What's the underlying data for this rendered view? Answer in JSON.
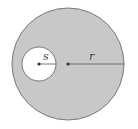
{
  "diagram": {
    "type": "geometry",
    "colors": {
      "shaded": "#c8c8c8",
      "hole": "#ffffff",
      "stroke": "#6e6e6e",
      "line": "#555555"
    },
    "outer_circle": {
      "cx": 68,
      "cy": 64,
      "r": 56
    },
    "inner_circle": {
      "cx": 39,
      "cy": 64,
      "r": 17
    },
    "labels": {
      "inner_radius": "s",
      "outer_radius": "r"
    }
  }
}
